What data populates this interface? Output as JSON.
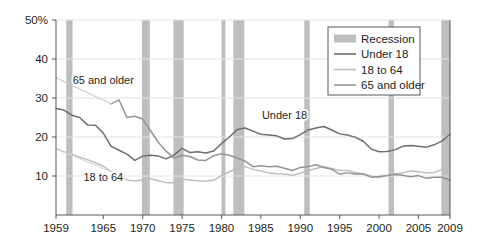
{
  "chart_data": {
    "type": "line",
    "title": "",
    "subtitle": "",
    "xlabel": "",
    "ylabel": "",
    "xlim": [
      1959,
      2009
    ],
    "ylim": [
      0,
      50
    ],
    "yticks": [
      10,
      20,
      30,
      40,
      50
    ],
    "ytick_labels": [
      "10",
      "20",
      "30",
      "40",
      "50%"
    ],
    "xticks": [
      1959,
      1965,
      1970,
      1975,
      1980,
      1985,
      1990,
      1995,
      2000,
      2005,
      2009
    ],
    "xtick_labels": [
      "1959",
      "1965",
      "1970",
      "1975",
      "1980",
      "1985",
      "1990",
      "1995",
      "2000",
      "2005",
      "2009"
    ],
    "grid": "horizontal",
    "legend_position": "top-right",
    "series": [
      {
        "name": "Under 18",
        "color": "#6d6e71",
        "style": "solid",
        "x": [
          1959,
          1960,
          1961,
          1962,
          1963,
          1964,
          1965,
          1966,
          1967,
          1968,
          1969,
          1970,
          1971,
          1972,
          1973,
          1974,
          1975,
          1976,
          1977,
          1978,
          1979,
          1980,
          1981,
          1982,
          1983,
          1984,
          1985,
          1986,
          1987,
          1988,
          1989,
          1990,
          1991,
          1992,
          1993,
          1994,
          1995,
          1996,
          1997,
          1998,
          1999,
          2000,
          2001,
          2002,
          2003,
          2004,
          2005,
          2006,
          2007,
          2008,
          2009
        ],
        "values": [
          27.3,
          26.9,
          25.6,
          25.0,
          23.1,
          23.0,
          21.0,
          17.6,
          16.6,
          15.6,
          14.0,
          15.1,
          15.3,
          15.1,
          14.4,
          15.4,
          17.1,
          16.0,
          16.2,
          15.9,
          16.4,
          18.3,
          20.0,
          21.9,
          22.3,
          21.5,
          20.7,
          20.5,
          20.3,
          19.5,
          19.6,
          20.6,
          21.8,
          22.3,
          22.7,
          21.8,
          20.8,
          20.5,
          19.9,
          18.9,
          16.9,
          16.2,
          16.3,
          16.7,
          17.6,
          17.8,
          17.6,
          17.4,
          18.0,
          19.0,
          20.7
        ]
      },
      {
        "name": "18 to 64",
        "color": "#bcbec0",
        "style": "solid",
        "x": [
          1959,
          1960,
          1961,
          1962,
          1963,
          1964,
          1965,
          1966,
          1967,
          1968,
          1969,
          1970,
          1971,
          1972,
          1973,
          1974,
          1975,
          1976,
          1977,
          1978,
          1979,
          1980,
          1981,
          1982,
          1983,
          1984,
          1985,
          1986,
          1987,
          1988,
          1989,
          1990,
          1991,
          1992,
          1993,
          1994,
          1995,
          1996,
          1997,
          1998,
          1999,
          2000,
          2001,
          2002,
          2003,
          2004,
          2005,
          2006,
          2007,
          2008,
          2009
        ],
        "values": [
          17.0,
          16.2,
          15.6,
          14.8,
          14.2,
          13.4,
          12.5,
          11.1,
          10.0,
          9.0,
          8.7,
          9.0,
          9.3,
          8.8,
          8.3,
          8.3,
          9.2,
          9.0,
          8.8,
          8.7,
          8.9,
          10.1,
          11.1,
          12.0,
          12.4,
          11.7,
          11.3,
          10.8,
          10.6,
          10.5,
          10.2,
          10.7,
          11.4,
          11.9,
          12.4,
          11.9,
          11.4,
          11.4,
          10.9,
          10.5,
          10.0,
          9.6,
          10.1,
          10.6,
          10.8,
          11.3,
          11.1,
          10.8,
          10.9,
          11.7,
          12.9
        ]
      },
      {
        "name": "65 and older",
        "color": "#929497",
        "style": "solid",
        "x": [
          1966,
          1967,
          1968,
          1969,
          1970,
          1971,
          1972,
          1973,
          1974,
          1975,
          1976,
          1977,
          1978,
          1979,
          1980,
          1981,
          1982,
          1983,
          1984,
          1985,
          1986,
          1987,
          1988,
          1989,
          1990,
          1991,
          1992,
          1993,
          1994,
          1995,
          1996,
          1997,
          1998,
          1999,
          2000,
          2001,
          2002,
          2003,
          2004,
          2005,
          2006,
          2007,
          2008,
          2009
        ],
        "values": [
          28.5,
          29.5,
          25.0,
          25.3,
          24.6,
          21.6,
          18.6,
          16.3,
          14.6,
          15.3,
          15.0,
          14.1,
          14.0,
          15.2,
          15.7,
          15.3,
          14.6,
          13.8,
          12.4,
          12.6,
          12.4,
          12.5,
          12.0,
          11.4,
          12.2,
          12.4,
          12.9,
          12.2,
          11.7,
          10.5,
          10.8,
          10.5,
          10.5,
          9.7,
          9.9,
          10.1,
          10.4,
          10.2,
          9.8,
          10.1,
          9.4,
          9.7,
          9.7,
          8.9
        ]
      },
      {
        "name": "65 and older (estimated)",
        "color": "#c7c8ca",
        "style": "dotted",
        "x": [
          1959,
          1966
        ],
        "values": [
          35.2,
          28.5
        ]
      },
      {
        "name": "18 to 64 (estimated)",
        "color": "#d5d6d8",
        "style": "dotted",
        "x": [
          1959,
          1966
        ],
        "values": [
          17.0,
          11.1
        ]
      }
    ],
    "recessions": [
      {
        "start": 1960.3,
        "end": 1961.1
      },
      {
        "start": 1969.9,
        "end": 1970.9
      },
      {
        "start": 1973.9,
        "end": 1975.2
      },
      {
        "start": 1980.0,
        "end": 1980.5
      },
      {
        "start": 1981.5,
        "end": 1982.9
      },
      {
        "start": 1990.5,
        "end": 1991.2
      },
      {
        "start": 2001.2,
        "end": 2001.9
      },
      {
        "start": 2007.9,
        "end": 2009.4
      }
    ],
    "recession_color": "#bcbec0",
    "annotations": [
      {
        "label": "65 and older",
        "x": 1965.0,
        "y": 33.5
      },
      {
        "label": "18 to 64",
        "x": 1965.0,
        "y": 8.6
      },
      {
        "label": "Under 18",
        "x": 1988.0,
        "y": 24.5
      }
    ]
  },
  "legend": {
    "items": [
      {
        "label": "Recession",
        "marker": "swatch",
        "color": "#bcbec0"
      },
      {
        "label": "Under 18",
        "marker": "line",
        "color": "#6d6e71"
      },
      {
        "label": "18 to 64",
        "marker": "line",
        "color": "#bcbec0"
      },
      {
        "label": "65 and older",
        "marker": "line",
        "color": "#929497"
      }
    ]
  }
}
